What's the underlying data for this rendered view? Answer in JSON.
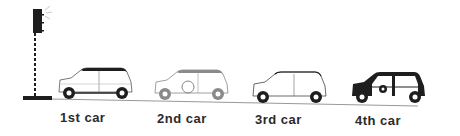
{
  "diagram": {
    "traffic_light": {
      "state": "lit-top"
    },
    "cars": [
      {
        "label": "1st car",
        "style": "white-body-dark-roof"
      },
      {
        "label": "2nd car",
        "style": "grey-outline-spare-wheel"
      },
      {
        "label": "3rd car",
        "style": "white-body-outline-roof"
      },
      {
        "label": "4th car",
        "style": "black-body-with-emblem"
      }
    ]
  },
  "colors": {
    "ink": "#1e1e1e",
    "grey": "#8a8a8a",
    "background": "#ffffff"
  }
}
